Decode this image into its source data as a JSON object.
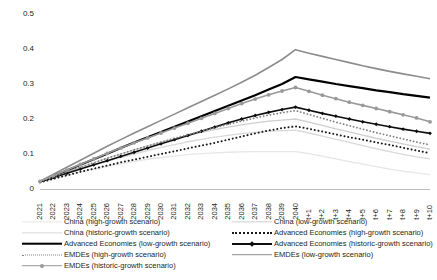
{
  "chart_data": {
    "type": "line",
    "title": "",
    "xlabel": "",
    "ylabel": "",
    "ylim": [
      0,
      0.5
    ],
    "yticks": [
      "0",
      "0.1",
      "0.2",
      "0.3",
      "0.4",
      "0.5"
    ],
    "ytick_values": [
      0,
      0.1,
      0.2,
      0.3,
      0.4,
      0.5
    ],
    "grid": false,
    "legend_position": "bottom",
    "categories": [
      "2021",
      "2022",
      "2023",
      "2024",
      "2025",
      "2026",
      "2027",
      "2028",
      "2029",
      "2030",
      "2031",
      "2032",
      "2033",
      "2034",
      "2035",
      "2036",
      "2037",
      "2038",
      "2039",
      "2040",
      "t+1",
      "t+2",
      "t+3",
      "t+4",
      "t+5",
      "t+6",
      "t+7",
      "t+8",
      "t+9",
      "t+10"
    ],
    "series": [
      {
        "name": "China (high-growth scenario)",
        "color": "#e6e6e6",
        "style": "solid",
        "width": 1.3,
        "marker": "none",
        "values": [
          0.019,
          0.029,
          0.039,
          0.048,
          0.057,
          0.065,
          0.072,
          0.079,
          0.085,
          0.09,
          0.094,
          0.098,
          0.101,
          0.103,
          0.105,
          0.106,
          0.107,
          0.107,
          0.107,
          0.107,
          0.101,
          0.094,
          0.086,
          0.078,
          0.071,
          0.064,
          0.057,
          0.051,
          0.046,
          0.041
        ]
      },
      {
        "name": "China (historic-growth scenario)",
        "color": "#d9d9d9",
        "style": "solid",
        "width": 1.3,
        "marker": "none",
        "values": [
          0.02,
          0.032,
          0.044,
          0.056,
          0.068,
          0.079,
          0.09,
          0.1,
          0.11,
          0.119,
          0.127,
          0.135,
          0.142,
          0.148,
          0.153,
          0.158,
          0.162,
          0.165,
          0.167,
          0.168,
          0.16,
          0.151,
          0.142,
          0.133,
          0.124,
          0.115,
          0.107,
          0.099,
          0.092,
          0.086
        ]
      },
      {
        "name": "China (low-growth scenario)",
        "color": "#cfcfcf",
        "style": "solid",
        "width": 1.3,
        "marker": "none",
        "values": [
          0.02,
          0.034,
          0.048,
          0.062,
          0.075,
          0.088,
          0.1,
          0.112,
          0.123,
          0.134,
          0.144,
          0.153,
          0.162,
          0.17,
          0.177,
          0.183,
          0.189,
          0.194,
          0.197,
          0.2,
          0.191,
          0.182,
          0.172,
          0.163,
          0.154,
          0.145,
          0.137,
          0.129,
          0.121,
          0.114
        ]
      },
      {
        "name": "Advanced Economies (high-growth scenario)",
        "color": "#1a1a1a",
        "style": "dotted",
        "width": 2.0,
        "marker": "none",
        "values": [
          0.019,
          0.029,
          0.039,
          0.049,
          0.058,
          0.067,
          0.076,
          0.084,
          0.092,
          0.1,
          0.108,
          0.116,
          0.124,
          0.132,
          0.141,
          0.15,
          0.159,
          0.167,
          0.174,
          0.179,
          0.172,
          0.164,
          0.156,
          0.148,
          0.141,
          0.133,
          0.126,
          0.118,
          0.11,
          0.102
        ]
      },
      {
        "name": "Advanced Economies (low-growth scenario)",
        "color": "#000000",
        "style": "solid",
        "width": 2.2,
        "marker": "none",
        "values": [
          0.021,
          0.037,
          0.053,
          0.069,
          0.085,
          0.101,
          0.117,
          0.133,
          0.148,
          0.163,
          0.178,
          0.193,
          0.208,
          0.223,
          0.238,
          0.253,
          0.268,
          0.284,
          0.3,
          0.32,
          0.313,
          0.307,
          0.3,
          0.294,
          0.288,
          0.282,
          0.277,
          0.271,
          0.266,
          0.261
        ]
      },
      {
        "name": "Advanced Economies (historic-growth scenario)",
        "color": "#0d0d0d",
        "style": "solid",
        "width": 1.6,
        "marker": "diamond",
        "values": [
          0.021,
          0.033,
          0.045,
          0.057,
          0.069,
          0.081,
          0.093,
          0.105,
          0.117,
          0.129,
          0.141,
          0.153,
          0.165,
          0.177,
          0.189,
          0.2,
          0.21,
          0.219,
          0.227,
          0.234,
          0.225,
          0.216,
          0.208,
          0.2,
          0.192,
          0.185,
          0.178,
          0.171,
          0.165,
          0.159
        ]
      },
      {
        "name": "EMDEs (high-growth scenario)",
        "color": "#808080",
        "style": "dotted",
        "width": 1.8,
        "marker": "none",
        "values": [
          0.021,
          0.035,
          0.049,
          0.062,
          0.075,
          0.088,
          0.1,
          0.112,
          0.123,
          0.134,
          0.145,
          0.155,
          0.165,
          0.175,
          0.185,
          0.194,
          0.203,
          0.211,
          0.218,
          0.224,
          0.213,
          0.202,
          0.191,
          0.181,
          0.171,
          0.161,
          0.152,
          0.143,
          0.134,
          0.126
        ]
      },
      {
        "name": "EMDEs (low-growth scenario)",
        "color": "#8c8c8c",
        "style": "solid",
        "width": 1.6,
        "marker": "none",
        "values": [
          0.022,
          0.042,
          0.062,
          0.082,
          0.102,
          0.122,
          0.141,
          0.16,
          0.178,
          0.196,
          0.214,
          0.232,
          0.25,
          0.268,
          0.286,
          0.305,
          0.325,
          0.347,
          0.37,
          0.398,
          0.388,
          0.379,
          0.37,
          0.361,
          0.352,
          0.344,
          0.336,
          0.329,
          0.322,
          0.315
        ]
      },
      {
        "name": "EMDEs (historic-growth scenario)",
        "color": "#999999",
        "style": "solid",
        "width": 1.6,
        "marker": "circle",
        "values": [
          0.022,
          0.038,
          0.054,
          0.07,
          0.086,
          0.102,
          0.117,
          0.132,
          0.146,
          0.16,
          0.174,
          0.188,
          0.202,
          0.216,
          0.23,
          0.244,
          0.257,
          0.269,
          0.28,
          0.29,
          0.279,
          0.268,
          0.258,
          0.248,
          0.239,
          0.23,
          0.221,
          0.212,
          0.203,
          0.192
        ]
      }
    ]
  },
  "legend": {
    "left_column": [
      {
        "label": "China (high-growth scenario)",
        "color": "#e6e6e6",
        "style": "solid",
        "marker": "none",
        "width": 1.3
      },
      {
        "label": "China (historic-growth scenario)",
        "color": "#d9d9d9",
        "style": "solid",
        "marker": "none",
        "width": 1.3
      },
      {
        "label": "Advanced Economies (low-growth scenario)",
        "color": "#000000",
        "style": "solid",
        "marker": "none",
        "width": 2.6
      },
      {
        "label": "EMDEs (high-growth scenario)",
        "color": "#808080",
        "style": "dotted",
        "marker": "none",
        "width": 1.8
      },
      {
        "label": "EMDEs (historic-growth scenario)",
        "color": "#999999",
        "style": "solid",
        "marker": "circle",
        "width": 1.6
      }
    ],
    "right_column": [
      {
        "label": "China (low-growth scenario)",
        "color": "#cfcfcf",
        "style": "solid",
        "marker": "none",
        "width": 1.3
      },
      {
        "label": "Advanced Economies (high-growth scenario)",
        "color": "#1a1a1a",
        "style": "dotted",
        "marker": "none",
        "width": 2.0
      },
      {
        "label": "Advanced Economies (historic-growth scenario)",
        "color": "#0d0d0d",
        "style": "solid",
        "marker": "diamond",
        "width": 2.0
      },
      {
        "label": "EMDEs (low-growth scenario)",
        "color": "#8c8c8c",
        "style": "solid",
        "marker": "none",
        "width": 1.6
      }
    ]
  },
  "axis": {
    "color": "#bfbfbf"
  }
}
